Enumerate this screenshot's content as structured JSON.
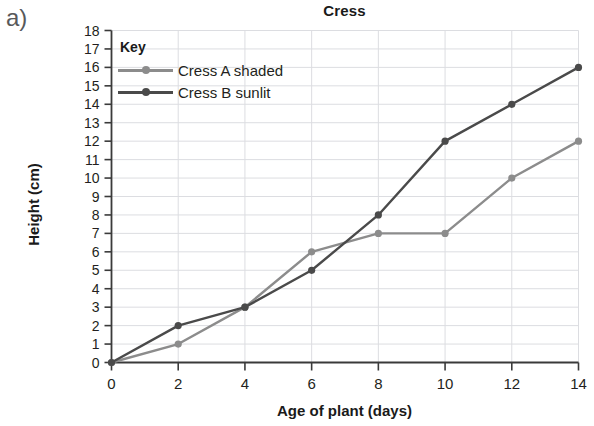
{
  "part_label": "a)",
  "legend": {
    "title": "Key",
    "entries": [
      {
        "label": "Cress A shaded",
        "color": "#8c8c8c"
      },
      {
        "label": "Cress B sunlit",
        "color": "#4a4a4a"
      }
    ]
  },
  "chart_data": {
    "type": "line",
    "title": "Cress",
    "xlabel": "Age of plant (days)",
    "ylabel": "Height (cm)",
    "x": [
      0,
      2,
      4,
      6,
      8,
      10,
      12,
      14
    ],
    "xlim": [
      0,
      14
    ],
    "ylim": [
      0,
      18
    ],
    "xticks": [
      "0",
      "2",
      "4",
      "6",
      "8",
      "10",
      "12",
      "14"
    ],
    "yticks": [
      "0",
      "1",
      "2",
      "3",
      "4",
      "5",
      "6",
      "7",
      "8",
      "9",
      "10",
      "11",
      "12",
      "13",
      "14",
      "15",
      "16",
      "17",
      "18"
    ],
    "grid": true,
    "legend_position": "inside-top-left",
    "series": [
      {
        "name": "Cress A shaded",
        "color": "#8c8c8c",
        "values": [
          0,
          1,
          3,
          6,
          7,
          7,
          10,
          12
        ]
      },
      {
        "name": "Cress B sunlit",
        "color": "#4a4a4a",
        "values": [
          0,
          2,
          3,
          5,
          8,
          12,
          14,
          16
        ]
      }
    ]
  },
  "colors": {
    "grid": "#dcdde1",
    "axis": "#3a3a3a",
    "text": "#231f20",
    "part_label": "#58595b"
  }
}
